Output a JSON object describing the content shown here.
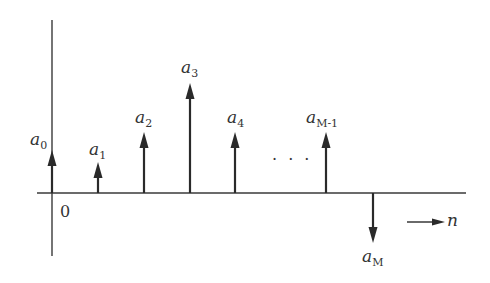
{
  "diagram": {
    "type": "discrete-time impulse sequence (stem plot)",
    "colors": {
      "stroke": "#2a2a2a",
      "text": "#333333",
      "background": "#ffffff"
    },
    "axes": {
      "origin_label": "0",
      "x_axis_label": "n",
      "x_axis_arrow": "right-arrow"
    },
    "ellipsis": "· · ·",
    "impulses": [
      {
        "label_base": "a",
        "label_sub": "0",
        "index": 0,
        "direction": "up",
        "x": 52,
        "tip_y": 150,
        "label_x": 30,
        "label_y": 133
      },
      {
        "label_base": "a",
        "label_sub": "1",
        "index": 1,
        "direction": "up",
        "x": 98,
        "tip_y": 162,
        "label_x": 89,
        "label_y": 142
      },
      {
        "label_base": "a",
        "label_sub": "2",
        "index": 2,
        "direction": "up",
        "x": 144,
        "tip_y": 132,
        "label_x": 135,
        "label_y": 110
      },
      {
        "label_base": "a",
        "label_sub": "3",
        "index": 3,
        "direction": "up",
        "x": 190,
        "tip_y": 83,
        "label_x": 181,
        "label_y": 60
      },
      {
        "label_base": "a",
        "label_sub": "4",
        "index": 4,
        "direction": "up",
        "x": 235,
        "tip_y": 132,
        "label_x": 227,
        "label_y": 110
      },
      {
        "label_base": "a",
        "label_sub": "M-1",
        "index": "M-1",
        "direction": "up",
        "x": 326,
        "tip_y": 132,
        "label_x": 306,
        "label_y": 110
      },
      {
        "label_base": "a",
        "label_sub": "M",
        "index": "M",
        "direction": "down",
        "x": 373,
        "tip_y": 243,
        "label_x": 362,
        "label_y": 247
      }
    ]
  }
}
